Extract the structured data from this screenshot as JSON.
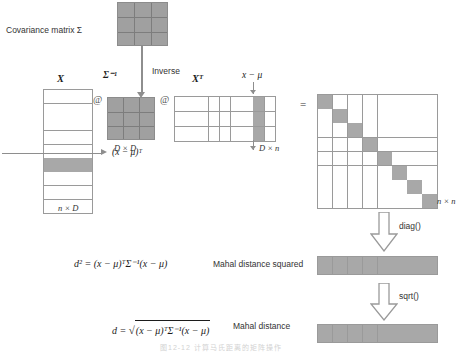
{
  "title_label": "Covariance matrix Σ",
  "labels": {
    "inverse": "Inverse",
    "sigma_inv": "Σ⁻¹",
    "X": "X",
    "XT": "Xᵀ",
    "x_minus_mu": "x − μ",
    "x_minus_mu_T": "(x − μ)ᵀ",
    "dim_DxD": "D × D",
    "dim_nxD": "n × D",
    "dim_Dxn": "D × n",
    "dim_nxn": "n × n",
    "equals": "=",
    "matmul": "@",
    "diag": "diag()",
    "sqrt": "sqrt()",
    "mahal_squared_text": "Mahal distance squared",
    "mahal_text": "Mahal distance",
    "d_squared_formula": "d² = (x − μ)ᵀΣ⁻¹(x − μ)",
    "d_formula_prefix": "d = ",
    "d_formula_radicand": "(x − μ)ᵀΣ⁻¹(x − μ)",
    "figure_caption": "图12-12   计算马氏距离的矩阵操作"
  },
  "matrices": {
    "covariance": {
      "rows": 3,
      "cols": 3,
      "fill": "all"
    },
    "sigma_inverse": {
      "rows": 3,
      "cols": 3,
      "fill": "all"
    },
    "X": {
      "rows": 9,
      "cols": 3,
      "highlight_row": 6
    },
    "XT": {
      "rows": 3,
      "cols": 9,
      "highlight_col": 8
    },
    "result_nxn": {
      "rows": 8,
      "cols": 8,
      "fill": "diagonal"
    },
    "diag_vector": {
      "rows": 1,
      "cols": 8,
      "fill": "all"
    },
    "sqrt_vector": {
      "rows": 1,
      "cols": 8,
      "fill": "all"
    }
  },
  "colors": {
    "fill_gray": "#a8a8a8",
    "grid_line": "#9a9a9a",
    "arrow_gray": "#8e8e8e",
    "text": "#2a2a2a",
    "background": "#ffffff"
  }
}
